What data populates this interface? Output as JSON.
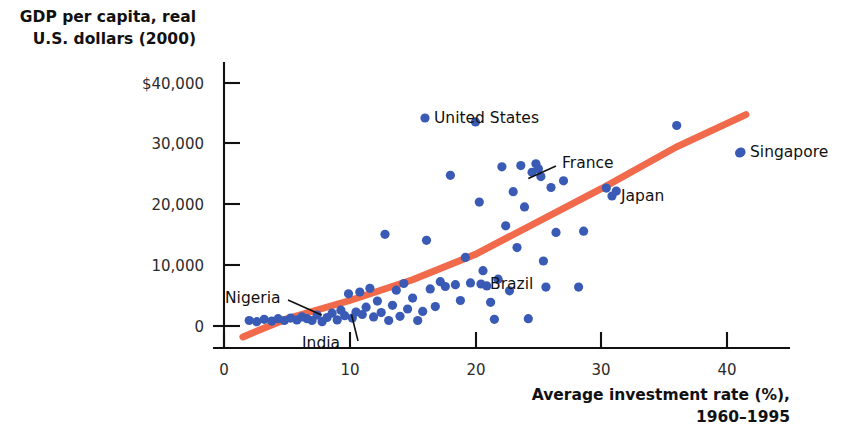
{
  "chart_data": {
    "type": "scatter",
    "title": "",
    "xlabel": "Average investment rate (%), 1960–1995",
    "xlabel_line1": "Average investment rate (%),",
    "xlabel_line2": "1960–1995",
    "ylabel": "GDP per capita, real U.S. dollars (2000)",
    "ylabel_line1": "GDP per capita, real",
    "ylabel_line2": "U.S. dollars (2000)",
    "xlim": [
      0,
      42
    ],
    "ylim": [
      -3000,
      43000
    ],
    "grid": false,
    "legend": "none",
    "xticks": [
      0,
      10,
      20,
      30,
      40
    ],
    "xtick_labels": [
      "0",
      "10",
      "20",
      "30",
      "40"
    ],
    "yticks": [
      0,
      10000,
      20000,
      30000,
      40000
    ],
    "ytick_labels": [
      "0",
      "10,000",
      "20,000",
      "30,000",
      "$40,000"
    ],
    "series_color": "#3a5bb5",
    "trendline": {
      "color": "#f06a4b",
      "type": "fitted-curve",
      "points": [
        [
          1.5,
          -1800
        ],
        [
          5,
          1200
        ],
        [
          10,
          4200
        ],
        [
          15,
          7600
        ],
        [
          20,
          11800
        ],
        [
          25,
          17200
        ],
        [
          30,
          22600
        ],
        [
          36,
          29500
        ],
        [
          41.5,
          34800
        ]
      ]
    },
    "points": [
      [
        2.0,
        900
      ],
      [
        2.6,
        700
      ],
      [
        3.2,
        1100
      ],
      [
        3.8,
        800
      ],
      [
        4.3,
        1200
      ],
      [
        4.8,
        900
      ],
      [
        5.3,
        1300
      ],
      [
        5.8,
        1000
      ],
      [
        6.2,
        1500
      ],
      [
        6.6,
        1200
      ],
      [
        7.0,
        900
      ],
      [
        7.4,
        1800
      ],
      [
        7.8,
        700
      ],
      [
        8.2,
        1400
      ],
      [
        8.6,
        2100
      ],
      [
        9.0,
        1000
      ],
      [
        9.3,
        2600
      ],
      [
        9.6,
        1700
      ],
      [
        9.9,
        5300
      ],
      [
        10.2,
        1300
      ],
      [
        10.5,
        2300
      ],
      [
        10.8,
        5600
      ],
      [
        11.0,
        1900
      ],
      [
        11.3,
        3100
      ],
      [
        11.6,
        6200
      ],
      [
        11.9,
        1500
      ],
      [
        12.2,
        4100
      ],
      [
        12.5,
        2200
      ],
      [
        12.8,
        15100
      ],
      [
        13.1,
        900
      ],
      [
        13.4,
        3400
      ],
      [
        13.7,
        5900
      ],
      [
        14.0,
        1600
      ],
      [
        14.3,
        7000
      ],
      [
        14.6,
        2800
      ],
      [
        15.0,
        4600
      ],
      [
        15.4,
        900
      ],
      [
        15.8,
        2400
      ],
      [
        16.1,
        14100
      ],
      [
        16.4,
        6100
      ],
      [
        16.8,
        3200
      ],
      [
        17.2,
        7300
      ],
      [
        17.6,
        6500
      ],
      [
        18.0,
        24800
      ],
      [
        18.4,
        6800
      ],
      [
        18.8,
        4200
      ],
      [
        19.2,
        11300
      ],
      [
        19.6,
        7100
      ],
      [
        20.0,
        33600
      ],
      [
        20.3,
        20400
      ],
      [
        20.6,
        9100
      ],
      [
        20.9,
        6600
      ],
      [
        21.2,
        3900
      ],
      [
        21.5,
        1100
      ],
      [
        21.8,
        7700
      ],
      [
        22.1,
        26200
      ],
      [
        22.4,
        16500
      ],
      [
        22.7,
        5800
      ],
      [
        23.0,
        22100
      ],
      [
        23.3,
        12900
      ],
      [
        23.6,
        26400
      ],
      [
        23.9,
        19600
      ],
      [
        24.2,
        1200
      ],
      [
        24.5,
        25300
      ],
      [
        24.8,
        26700
      ],
      [
        25.0,
        25900
      ],
      [
        25.2,
        24600
      ],
      [
        25.4,
        10700
      ],
      [
        25.6,
        6400
      ],
      [
        26.0,
        22800
      ],
      [
        26.4,
        15400
      ],
      [
        27.0,
        23900
      ],
      [
        28.2,
        6400
      ],
      [
        28.6,
        15600
      ],
      [
        30.4,
        22700
      ],
      [
        31.2,
        22200
      ],
      [
        36.0,
        33000
      ],
      [
        41.0,
        28500
      ]
    ],
    "annotations": [
      {
        "label": "United States",
        "x": 20.0,
        "y": 33600,
        "side": "right",
        "leader": false
      },
      {
        "label": "France",
        "x": 24.2,
        "y": 24300,
        "side": "right",
        "leader": true
      },
      {
        "label": "Japan",
        "x": 31.2,
        "y": 22200,
        "side": "right",
        "leader": false
      },
      {
        "label": "Singapore",
        "x": 41.0,
        "y": 28500,
        "side": "right",
        "leader": false
      },
      {
        "label": "Brazil",
        "x": 20.0,
        "y": 7000,
        "side": "right",
        "leader": false
      },
      {
        "label": "Nigeria",
        "x": 7.6,
        "y": 1300,
        "side": "upper-left",
        "leader": true
      },
      {
        "label": "India",
        "x": 9.9,
        "y": 1400,
        "side": "lower-left",
        "leader": true
      }
    ]
  }
}
